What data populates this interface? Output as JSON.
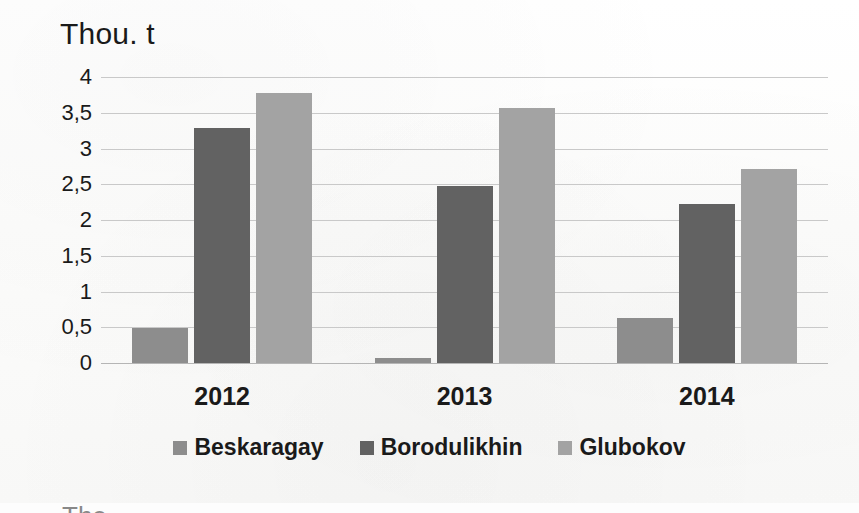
{
  "chart_data": {
    "type": "bar",
    "title": "Thou. t",
    "xlabel": "",
    "ylabel": "Thou. t",
    "categories": [
      "2012",
      "2013",
      "2014"
    ],
    "series": [
      {
        "name": "Beskaragay",
        "color": "#8d8d8d",
        "values": [
          0.49,
          0.07,
          0.63
        ]
      },
      {
        "name": "Borodulikhin",
        "color": "#626262",
        "values": [
          3.29,
          2.47,
          2.22
        ]
      },
      {
        "name": "Glubokov",
        "color": "#a3a3a3",
        "values": [
          3.78,
          3.56,
          2.72
        ]
      }
    ],
    "ylim": [
      0,
      4
    ],
    "yticks": [
      "4",
      "3,5",
      "3",
      "2,5",
      "2",
      "1,5",
      "1",
      "0,5",
      "0"
    ],
    "ytick_values": [
      4,
      3.5,
      3,
      2.5,
      2,
      1.5,
      1,
      0.5,
      0
    ],
    "grid": true,
    "legend_position": "bottom",
    "decimal_separator": ","
  },
  "caption_fragment": "The ..."
}
